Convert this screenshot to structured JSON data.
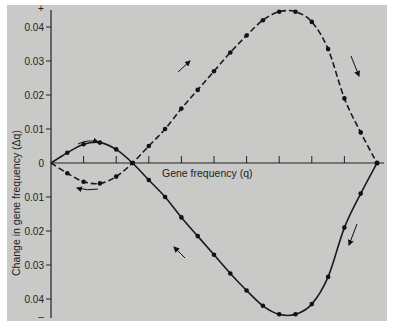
{
  "chart_data": {
    "type": "line",
    "title": "",
    "xlabel": "Gene frequency (q)",
    "ylabel": "Change in gene frequency (Δq)",
    "xlim": [
      0,
      1
    ],
    "ylim": [
      -0.045,
      0.045
    ],
    "grid": false,
    "legend": null,
    "y_top_marker": "+",
    "y_bottom_marker": "–",
    "y_ticks": [
      {
        "value": 0.04,
        "label": "0.04"
      },
      {
        "value": 0.03,
        "label": "0.03"
      },
      {
        "value": 0.02,
        "label": "0.02"
      },
      {
        "value": 0.01,
        "label": "0.01"
      },
      {
        "value": 0,
        "label": "0"
      },
      {
        "value": -0.01,
        "label": "0.01"
      },
      {
        "value": -0.02,
        "label": "0.02"
      },
      {
        "value": -0.03,
        "label": "0.03"
      },
      {
        "value": -0.04,
        "label": "0.04"
      }
    ],
    "x_ticks": [
      0,
      0.1,
      0.2,
      0.3,
      0.4,
      0.5,
      0.6,
      0.7,
      0.8,
      0.9,
      1.0
    ],
    "series": [
      {
        "name": "dashed curve",
        "style": "dashed",
        "x": [
          0,
          0.05,
          0.1,
          0.15,
          0.2,
          0.25,
          0.3,
          0.35,
          0.4,
          0.45,
          0.5,
          0.55,
          0.6,
          0.65,
          0.7,
          0.75,
          0.8,
          0.85,
          0.9,
          0.95,
          1.0
        ],
        "values": [
          0,
          -0.003,
          -0.0055,
          -0.006,
          -0.004,
          0,
          0.005,
          0.01,
          0.016,
          0.0215,
          0.027,
          0.0325,
          0.0375,
          0.042,
          0.0445,
          0.0445,
          0.0415,
          0.0335,
          0.019,
          0.009,
          0
        ]
      },
      {
        "name": "solid curve",
        "style": "solid",
        "x": [
          0,
          0.05,
          0.1,
          0.15,
          0.2,
          0.25,
          0.3,
          0.35,
          0.4,
          0.45,
          0.5,
          0.55,
          0.6,
          0.65,
          0.7,
          0.75,
          0.8,
          0.85,
          0.9,
          0.95,
          1.0
        ],
        "values": [
          0,
          0.003,
          0.0055,
          0.006,
          0.004,
          0,
          -0.005,
          -0.01,
          -0.016,
          -0.0215,
          -0.027,
          -0.0325,
          -0.0375,
          -0.042,
          -0.0445,
          -0.0445,
          -0.0415,
          -0.0335,
          -0.019,
          -0.009,
          0
        ]
      }
    ],
    "annotations": [
      {
        "type": "arrow",
        "near": [
          0.12,
          0.0075
        ],
        "direction": "right"
      },
      {
        "type": "arrow",
        "near": [
          0.12,
          -0.0075
        ],
        "direction": "left"
      },
      {
        "type": "arrow",
        "near": [
          0.43,
          0.025
        ],
        "direction": "up-right"
      },
      {
        "type": "arrow",
        "near": [
          0.43,
          -0.025
        ],
        "direction": "up-left"
      },
      {
        "type": "arrow",
        "near": [
          0.94,
          0.032
        ],
        "direction": "down"
      },
      {
        "type": "arrow",
        "near": [
          0.94,
          -0.032
        ],
        "direction": "down-left"
      }
    ]
  }
}
